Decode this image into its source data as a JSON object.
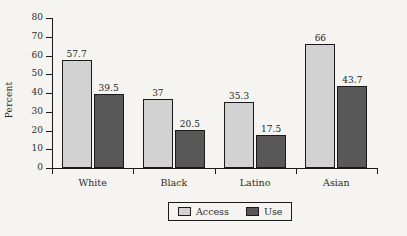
{
  "chart_data": {
    "type": "bar",
    "title": "",
    "xlabel": "",
    "ylabel": "Percent",
    "ylim": [
      0,
      80
    ],
    "yticks": [
      0,
      10,
      20,
      30,
      40,
      50,
      60,
      70,
      80
    ],
    "ytick_labels": [
      "0",
      "10",
      "20",
      "30",
      "40",
      "50",
      "60",
      "70",
      "80"
    ],
    "grid": false,
    "legend_position": "bottom-center",
    "categories": [
      "White",
      "Black",
      "Latino",
      "Asian"
    ],
    "series": [
      {
        "name": "Access",
        "color": "#d2d2d2",
        "values": [
          57.7,
          37,
          35.3,
          66
        ],
        "labels": [
          "57.7",
          "37",
          "35.3",
          "66"
        ]
      },
      {
        "name": "Use",
        "color": "#585858",
        "values": [
          39.5,
          20.5,
          17.5,
          43.7
        ],
        "labels": [
          "39.5",
          "20.5",
          "17.5",
          "43.7"
        ]
      }
    ]
  },
  "legend": {
    "items": [
      {
        "label": "Access",
        "color": "#d2d2d2"
      },
      {
        "label": "Use",
        "color": "#585858"
      }
    ]
  },
  "colors": {
    "background": "#f6f4f0",
    "axis": "#1c1c1c",
    "text": "#2b2b2b",
    "access": "#d2d2d2",
    "use": "#585858"
  }
}
